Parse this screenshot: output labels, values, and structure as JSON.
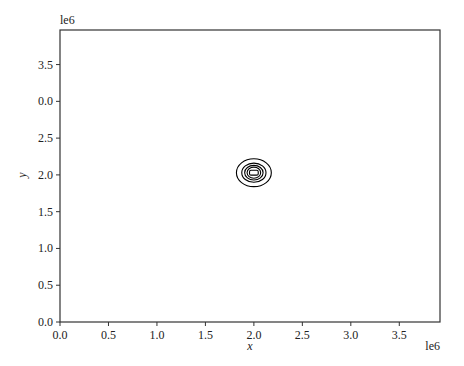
{
  "chart_data": {
    "type": "contour",
    "title": "",
    "xlabel": "x",
    "ylabel": "y",
    "x_offset_text": "le6",
    "y_offset_text": "le6",
    "xlim": [
      0,
      3.92
    ],
    "ylim": [
      0,
      3.97
    ],
    "xticks": [
      0.0,
      0.5,
      1.0,
      1.5,
      2.0,
      2.5,
      3.0,
      3.5
    ],
    "xtick_labels": [
      "0.0",
      "0.5",
      "1.0",
      "1.5",
      "2.0",
      "2.5",
      "3.0",
      "3.5"
    ],
    "yticks": [
      0.0,
      0.5,
      1.0,
      1.5,
      2.0,
      2.5,
      3.0,
      3.5
    ],
    "ytick_labels": [
      "0.0",
      "0.5",
      "1.0",
      "1.5",
      "2.0",
      "2.5",
      "0.0",
      "3.5"
    ],
    "grid": false,
    "legend": null,
    "contours": {
      "center": [
        2.0,
        2.03
      ],
      "levels": [
        {
          "rx": 0.18,
          "ry": 0.19,
          "shape": "ellipse"
        },
        {
          "rx": 0.125,
          "ry": 0.13,
          "shape": "ellipse"
        },
        {
          "rx": 0.095,
          "ry": 0.1,
          "shape": "ellipse"
        },
        {
          "rx": 0.07,
          "ry": 0.075,
          "shape": "ellipse"
        },
        {
          "rx": 0.045,
          "ry": 0.045,
          "shape": "rounded-rect"
        }
      ],
      "color": "#000000"
    }
  }
}
